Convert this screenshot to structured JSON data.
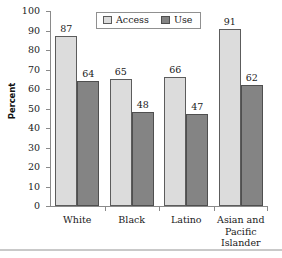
{
  "chart_data": {
    "type": "bar",
    "title": "",
    "subtitle": "",
    "xlabel": "",
    "ylabel": "Percent",
    "ylim": [
      0,
      100
    ],
    "ytick_step": 10,
    "yticks": [
      100,
      90,
      80,
      70,
      60,
      50,
      40,
      30,
      20,
      10,
      0
    ],
    "grid": false,
    "legend_position": "top-center",
    "categories": [
      "White",
      "Black",
      "Latino",
      "Asian and Pacific Islander"
    ],
    "category_lines": [
      [
        "White"
      ],
      [
        "Black"
      ],
      [
        "Latino"
      ],
      [
        "Asian and",
        "Pacific",
        "Islander"
      ]
    ],
    "series": [
      {
        "name": "Access",
        "color": "#dcdcdc",
        "border_color": "#5c5c5c",
        "values": [
          87,
          65,
          66,
          91
        ]
      },
      {
        "name": "Use",
        "color": "#848484",
        "border_color": "#4f4f4f",
        "values": [
          64,
          48,
          47,
          62
        ]
      }
    ],
    "data_labels": [
      {
        "category": "White",
        "Access": 87,
        "Use": 64
      },
      {
        "category": "Black",
        "Access": 65,
        "Use": 48
      },
      {
        "category": "Latino",
        "Access": 66,
        "Use": 47
      },
      {
        "category": "Asian and Pacific Islander",
        "Access": 91,
        "Use": 62
      }
    ],
    "axis_color": "#8a8a8a",
    "text_color": "#1a1a1a"
  },
  "legend": {
    "items": [
      {
        "label": "Access",
        "swatch": "access"
      },
      {
        "label": "Use",
        "swatch": "use"
      }
    ]
  }
}
